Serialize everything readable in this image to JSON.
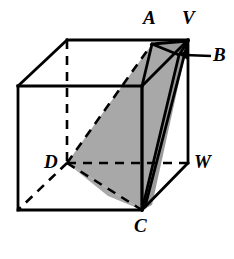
{
  "figure": {
    "background_color": "#ffffff",
    "stroke_color": "#000000",
    "shade_color": "#a8a8a8",
    "shade_color_dark": "#949494",
    "width": 234,
    "height": 259
  },
  "labels": {
    "a": "A",
    "v": "V",
    "b": "B",
    "d": "D",
    "w": "W",
    "c": "C"
  },
  "geometry": {
    "cube": {
      "front_top_left": [
        18,
        86
      ],
      "front_top_right": [
        142,
        86
      ],
      "front_bottom_left": [
        18,
        210
      ],
      "front_bottom_right": [
        142,
        210
      ],
      "back_top_left": [
        67,
        40
      ],
      "back_top_right": [
        188,
        40
      ],
      "back_bottom_left": [
        67,
        163
      ],
      "back_bottom_right": [
        188,
        163
      ]
    },
    "points": {
      "A": [
        152,
        44
      ],
      "V": [
        188,
        40
      ],
      "B": [
        179,
        54
      ],
      "D": [
        67,
        163
      ],
      "W": [
        188,
        163
      ],
      "C": [
        142,
        210
      ]
    },
    "hidden_edges": [
      "back_top_left-back_bottom_left",
      "back_bottom_left-front_bottom_left",
      "back_bottom_left-back_bottom_right"
    ],
    "shaded_faces": [
      "D-A-B-C",
      "A-B-V",
      "B-C-edge"
    ]
  },
  "annotations": {
    "b_leader": {
      "name": "arrow-to-b",
      "from": [
        210,
        56
      ],
      "to": [
        181,
        54
      ]
    }
  }
}
